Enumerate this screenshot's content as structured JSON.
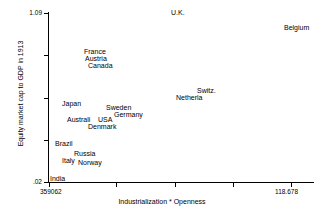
{
  "chart_data": {
    "type": "scatter",
    "title": "",
    "xlabel": "Industrialization * Openness",
    "ylabel": "Equity market cap to GDP in 1913",
    "xlim": [
      359062,
      118678
    ],
    "ylim": [
      0.02,
      1.09
    ],
    "x_tick_labels": [
      "359062",
      "118.678"
    ],
    "y_tick_labels": [
      "1.09",
      ".02"
    ],
    "grid": false,
    "legend": null,
    "marker_style": "text-label-only",
    "points": [
      {
        "label": "U.K.",
        "px": 171,
        "py": 9
      },
      {
        "label": "Belgium",
        "px": 284,
        "py": 24
      },
      {
        "label": "France",
        "px": 84,
        "py": 48
      },
      {
        "label": "Austria",
        "px": 85,
        "py": 55
      },
      {
        "label": "Canada",
        "px": 88,
        "py": 62
      },
      {
        "label": "Switz.",
        "px": 197,
        "py": 87
      },
      {
        "label": "Netherla",
        "px": 176,
        "py": 94
      },
      {
        "label": "Japan",
        "px": 62,
        "py": 100
      },
      {
        "label": "Sweden",
        "px": 106,
        "py": 104
      },
      {
        "label": "Germany",
        "px": 114,
        "py": 111
      },
      {
        "label": "Australi",
        "px": 67,
        "py": 116
      },
      {
        "label": "USA",
        "px": 98,
        "py": 116
      },
      {
        "label": "Denmark",
        "px": 88,
        "py": 123
      },
      {
        "label": "Brazil",
        "px": 55,
        "py": 140
      },
      {
        "label": "Russia",
        "px": 74,
        "py": 150
      },
      {
        "label": "Italy",
        "px": 62,
        "py": 157
      },
      {
        "label": "Norway",
        "px": 78,
        "py": 159
      },
      {
        "label": "India",
        "px": 50,
        "py": 175
      }
    ],
    "y_ticks_px": [
      13,
      55,
      98,
      140,
      182
    ],
    "x_ticks_px": [
      49,
      116,
      175,
      233,
      291
    ]
  },
  "axes": {
    "y_top_label": "1.09",
    "y_bottom_label": ".02",
    "x_left_label": "359062",
    "x_right_label": "118.678",
    "x_title": "Industrialization * Openness",
    "y_title": "Equity market cap to GDP in 1913"
  },
  "colors": {
    "axis": "#000000",
    "text": "#000000",
    "background": "#ffffff"
  }
}
